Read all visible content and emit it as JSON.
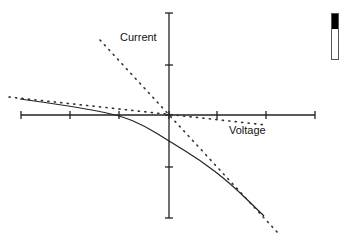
{
  "diagram": {
    "title": "",
    "labels": {
      "y_axis": "Current",
      "x_axis": "Voltage"
    },
    "colors": {
      "axis": "#222222",
      "curve": "#222222",
      "dotted": "#333333",
      "background": "#ffffff"
    },
    "axes": {
      "origin": [
        169,
        115
      ],
      "x_range_px": [
        21,
        315
      ],
      "y_range_px": [
        13,
        218
      ],
      "x_ticks_px": [
        21,
        70,
        119,
        169,
        217,
        266,
        315
      ],
      "y_ticks_px": [
        13,
        65,
        115,
        167,
        218
      ]
    },
    "curves": [
      {
        "name": "iv-curve",
        "style": "solid",
        "points": [
          [
            20,
            99
          ],
          [
            70,
            106
          ],
          [
            119,
            115
          ],
          [
            145,
            126
          ],
          [
            169,
            141
          ],
          [
            200,
            160
          ],
          [
            230,
            183
          ],
          [
            264,
            216
          ]
        ]
      },
      {
        "name": "shallow-tangent-line",
        "style": "dotted",
        "points": [
          [
            9,
            97
          ],
          [
            266,
            125
          ]
        ]
      },
      {
        "name": "steep-tangent-line",
        "style": "dotted",
        "points": [
          [
            100,
            40
          ],
          [
            278,
            233
          ]
        ]
      }
    ]
  },
  "chart_data": {
    "type": "line",
    "title": "",
    "xlabel": "Voltage",
    "ylabel": "Current",
    "grid": false,
    "axis_style": "cross-through-origin",
    "x_ticks": [
      -3,
      -2,
      -1,
      0,
      1,
      2,
      3
    ],
    "y_ticks": [
      -2,
      -1,
      0,
      1,
      2
    ],
    "xlim": [
      -3,
      3
    ],
    "ylim": [
      -2,
      2
    ],
    "series": [
      {
        "name": "I-V curve",
        "style": "solid",
        "x": [
          -3.0,
          -2.0,
          -1.0,
          -0.5,
          0.0,
          0.63,
          1.24,
          1.94
        ],
        "y": [
          0.31,
          0.18,
          0.0,
          -0.22,
          -0.51,
          -0.88,
          -1.33,
          -1.98
        ]
      },
      {
        "name": "asymptote (shallow)",
        "style": "dotted",
        "x": [
          -3.27,
          1.98
        ],
        "y": [
          0.35,
          -0.2
        ]
      },
      {
        "name": "asymptote (steep)",
        "style": "dotted",
        "x": [
          -1.41,
          2.22
        ],
        "y": [
          1.47,
          -2.31
        ]
      }
    ],
    "annotations": [
      {
        "text": "Current",
        "near": "y-axis top-left"
      },
      {
        "text": "Voltage",
        "near": "x-axis right, below"
      }
    ]
  }
}
